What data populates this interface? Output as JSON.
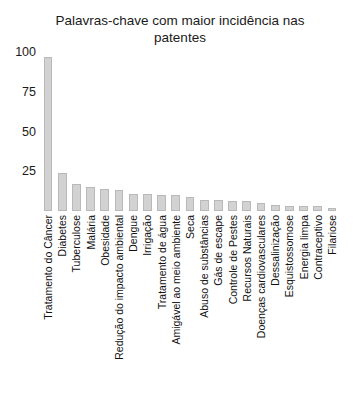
{
  "chart_data": {
    "type": "bar",
    "title": "Palavras-chave com maior incidência nas patentes",
    "title_line1": "Palavras-chave com maior incidência nas",
    "title_line2": "patentes",
    "xlabel": "",
    "ylabel": "",
    "ylim": [
      0,
      100
    ],
    "yticks": [
      25,
      50,
      75,
      100
    ],
    "grid": false,
    "legend": false,
    "bar_color": "#d2d2d2",
    "bar_edge_color": "#b9b9b9",
    "background": "#ffffff",
    "text_color": "#1a1a1a",
    "categories": [
      "Tratamento do Câncer",
      "Diabetes",
      "Tuberculose",
      "Malária",
      "Obesidade",
      "Redução do impacto ambiental",
      "Dengue",
      "Irrigação",
      "Tratamento de água",
      "Amigável ao meio ambiente",
      "Seca",
      "Abuso de substâncias",
      "Gás de escape",
      "Controle de Pestes",
      "Recursos Naturais",
      "Doenças cardiovasculares",
      "Dessalinização",
      "Esquistossomose",
      "Energia limpa",
      "Contraceptivo",
      "Filariose"
    ],
    "values": [
      97,
      24,
      17,
      15,
      14,
      13,
      11,
      11,
      10,
      10,
      9,
      7,
      7,
      6,
      6,
      5,
      4,
      3,
      3,
      3,
      2
    ]
  }
}
